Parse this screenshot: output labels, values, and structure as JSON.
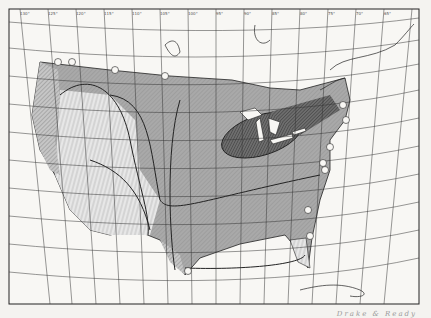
{
  "map": {
    "title": "Map of the United States with shaded isoline zones",
    "region": "United States",
    "caption": "Drake & Ready",
    "projection": "conic graticule",
    "top_longitude_labels": [
      "130°",
      "125°",
      "120°",
      "115°",
      "110°",
      "105°",
      "100°",
      "95°",
      "90°",
      "85°",
      "80°",
      "75°",
      "70°",
      "65°",
      "60°",
      "55°"
    ],
    "bottom_longitude_labels": [
      "115°",
      "110°",
      "105°",
      "100°",
      "95°",
      "90°",
      "85°",
      "80°",
      "75°"
    ],
    "left_latitude_labels": [
      "50°",
      "45°",
      "40°",
      "35°",
      "30°",
      "25°"
    ],
    "zones": [
      {
        "name": "heaviest-zone",
        "pattern": "dense-crosshatch",
        "location": "Great Lakes / Northeast"
      },
      {
        "name": "heavy-zone",
        "pattern": "dark-shade",
        "location": "Midwest, East, South"
      },
      {
        "name": "medium-zone",
        "pattern": "light-shade",
        "location": "Great Plains"
      },
      {
        "name": "light-zone",
        "pattern": "vertical-hatch",
        "location": "Intermountain West"
      },
      {
        "name": "coastal-zone",
        "pattern": "diagonal-hatch",
        "location": "Pacific Northwest coast, Florida, S. Texas"
      }
    ],
    "station_markers": 14,
    "colors": {
      "paper": "#f4f3f0",
      "ink": "#222222",
      "shade": "#b9b9b9",
      "dark_shade": "#7a7a7a"
    }
  }
}
